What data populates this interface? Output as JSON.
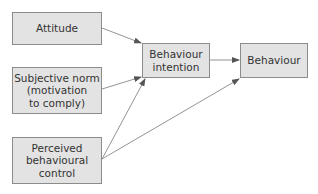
{
  "diagram": {
    "nodes": {
      "attitude": {
        "label": "Attitude"
      },
      "subjective_norm": {
        "label": "Subjective norm\n(motivation\nto comply)"
      },
      "perceived_control": {
        "label": "Perceived\nbehavioural\ncontrol"
      },
      "intention": {
        "label": "Behaviour\nintention"
      },
      "behaviour": {
        "label": "Behaviour"
      }
    },
    "edges": [
      {
        "from": "Attitude",
        "to": "Behaviour intention"
      },
      {
        "from": "Subjective norm (motivation to comply)",
        "to": "Behaviour intention"
      },
      {
        "from": "Perceived behavioural control",
        "to": "Behaviour intention"
      },
      {
        "from": "Perceived behavioural control",
        "to": "Behaviour"
      },
      {
        "from": "Behaviour intention",
        "to": "Behaviour"
      }
    ],
    "colors": {
      "box_fill": "#e3e3e3",
      "box_border": "#8c8c8c",
      "arrow": "#666666",
      "text": "#333333"
    }
  }
}
